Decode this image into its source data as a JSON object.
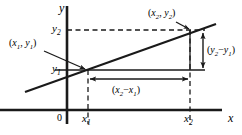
{
  "figure": {
    "kind": "coordinate-geometry-slope-diagram",
    "background_color": "#ffffff",
    "ink_color": "#1a1a1a",
    "axes": {
      "x_axis_label": "x",
      "y_axis_label": "y",
      "origin_label": "0"
    },
    "tick_labels": {
      "x1": "x",
      "x1_sub": "1",
      "x2": "x",
      "x2_sub": "2",
      "y1": "y",
      "y1_sub": "1",
      "y2": "y",
      "y2_sub": "2"
    },
    "point_labels": {
      "p1_open": "(",
      "p1_x": "x",
      "p1_x_sub": "1",
      "p1_comma": ", ",
      "p1_y": "y",
      "p1_y_sub": "1",
      "p1_close": ")",
      "p2_open": "(",
      "p2_x": "x",
      "p2_x_sub": "2",
      "p2_comma": ", ",
      "p2_y": "y",
      "p2_y_sub": "2",
      "p2_close": ")"
    },
    "measure_labels": {
      "run_open": "(",
      "run_a": "x",
      "run_a_sub": "2",
      "run_minus": "−",
      "run_b": "x",
      "run_b_sub": "1",
      "run_close": ")",
      "rise_open": "(",
      "rise_a": "y",
      "rise_a_sub": "2",
      "rise_minus": "−",
      "rise_b": "y",
      "rise_b_sub": "1",
      "rise_close": ")"
    },
    "geometry": {
      "x_axis_y": 110,
      "y_axis_x": 67,
      "x1_px": 88,
      "x2_px": 190,
      "y1_px": 70,
      "y2_px": 30,
      "line_start": [
        25,
        92
      ],
      "line_end": [
        216,
        24
      ]
    }
  }
}
